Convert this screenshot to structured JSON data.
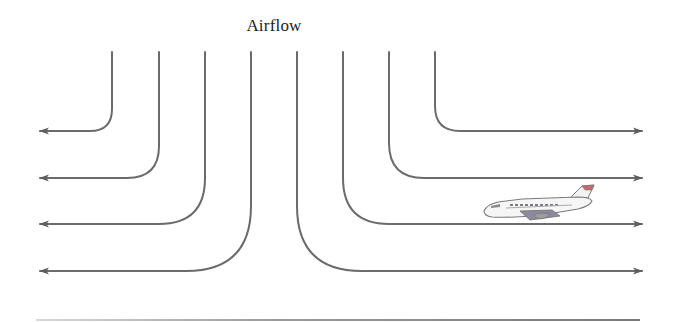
{
  "diagram": {
    "title": "Airflow",
    "type": "airflow-streamlines",
    "colors": {
      "line": "#6b6b6b",
      "arrowhead": "#5e5e5e",
      "background": "#ffffff",
      "plane_body": "#f4f4f4",
      "plane_outline": "#7a7a7a",
      "plane_tail_accent": "#c96a6a",
      "plane_wing": "#8d8aa0"
    },
    "streamlines": {
      "left": [
        {
          "x_top": 112,
          "y_exit": 131,
          "direction": "left"
        },
        {
          "x_top": 159,
          "y_exit": 178,
          "direction": "left"
        },
        {
          "x_top": 205,
          "y_exit": 224,
          "direction": "left"
        },
        {
          "x_top": 251,
          "y_exit": 271,
          "direction": "left"
        }
      ],
      "right": [
        {
          "x_top": 435,
          "y_exit": 131,
          "direction": "right"
        },
        {
          "x_top": 389,
          "y_exit": 178,
          "direction": "right"
        },
        {
          "x_top": 343,
          "y_exit": 224,
          "direction": "right"
        },
        {
          "x_top": 297,
          "y_exit": 271,
          "direction": "right"
        }
      ]
    },
    "objects": [
      {
        "name": "airplane",
        "position": "right side between 2nd and 3rd streamlines"
      }
    ]
  }
}
